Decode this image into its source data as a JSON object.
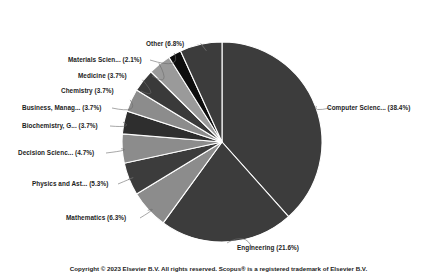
{
  "chart_data": {
    "type": "pie",
    "title": "",
    "legend_position": "labels-with-leader-lines",
    "start_angle_deg": 0,
    "direction": "clockwise",
    "categories": [
      "Computer Scienc...",
      "Engineering",
      "Mathematics",
      "Physics and Ast...",
      "Decision Scienc...",
      "Biochemistry, G...",
      "Business, Manag...",
      "Chemistry",
      "Medicine",
      "Materials Scien...",
      "Other"
    ],
    "values": [
      38.4,
      21.6,
      6.3,
      5.3,
      4.7,
      3.7,
      3.7,
      3.7,
      3.7,
      2.1,
      6.8
    ],
    "unit": "%",
    "colors": [
      "#3c3c3c",
      "#3c3c3c",
      "#8c8c8c",
      "#3c3c3c",
      "#8c8c8c",
      "#2e2e2e",
      "#8c8c8c",
      "#3a3a3a",
      "#9a9a9a",
      "#0d0d0d",
      "#3c3c3c"
    ],
    "slice_labels": [
      "Computer Scienc... (38.4%)",
      "Engineering (21.6%)",
      "Mathematics (6.3%)",
      "Physics and Ast... (5.3%)",
      "Decision Scienc... (4.7%)",
      "Biochemistry, G... (3.7%)",
      "Business, Manag... (3.7%)",
      "Chemistry (3.7%)",
      "Medicine (3.7%)",
      "Materials Scien... (2.1%)",
      "Other (6.8%)"
    ]
  },
  "footer": {
    "copyright": "Copyright © 2023 Elsevier B.V. All rights reserved. Scopus® is a registered trademark of Elsevier B.V."
  }
}
